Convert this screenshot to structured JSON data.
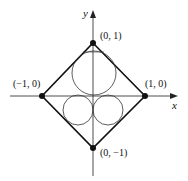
{
  "diagram": {
    "axes": {
      "x_label": "x",
      "y_label": "y"
    },
    "vertices": [
      {
        "id": "top",
        "label": "(0, 1)",
        "coord": [
          0,
          1
        ]
      },
      {
        "id": "right",
        "label": "(1, 0)",
        "coord": [
          1,
          0
        ]
      },
      {
        "id": "bottom",
        "label": "(0, −1)",
        "coord": [
          0,
          -1
        ]
      },
      {
        "id": "left",
        "label": "(−1, 0)",
        "coord": [
          -1,
          0
        ]
      }
    ],
    "shapes": {
      "square": "diamond |x|+|y|=1",
      "circles": [
        {
          "id": "upper-circle",
          "position": "upper half, centered on y-axis"
        },
        {
          "id": "lower-left-circle",
          "position": "lower-left"
        },
        {
          "id": "lower-right-circle",
          "position": "lower-right"
        }
      ]
    },
    "colors": {
      "stroke": "#111111",
      "background": "#ffffff"
    }
  }
}
